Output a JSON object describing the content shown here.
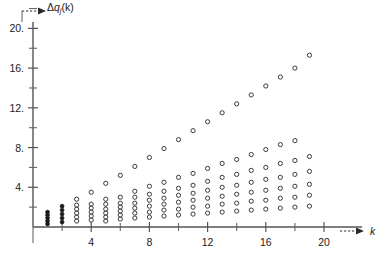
{
  "axes": {
    "y": {
      "label_delta": "Δ",
      "label_q": "q",
      "label_sub": "j",
      "label_arg": "(k)",
      "ticks_major": [
        {
          "value": 4,
          "text": "4."
        },
        {
          "value": 8,
          "text": "8."
        },
        {
          "value": 12,
          "text": "12."
        },
        {
          "value": 16,
          "text": "16."
        },
        {
          "value": 20,
          "text": "20."
        }
      ],
      "ticks_minor": [
        2,
        6,
        10,
        14,
        18,
        22
      ],
      "range": [
        0,
        23
      ]
    },
    "x": {
      "label": "k",
      "ticks_major": [
        {
          "value": 4,
          "text": "4"
        },
        {
          "value": 8,
          "text": "8"
        },
        {
          "value": 12,
          "text": "12"
        },
        {
          "value": 16,
          "text": "16"
        },
        {
          "value": 20,
          "text": "20"
        }
      ],
      "ticks_minor": [
        2,
        6,
        10,
        14,
        18
      ],
      "range": [
        0,
        22
      ]
    }
  },
  "colors": {
    "axis": "#555555",
    "marker": "#3a3a3a",
    "marker_dense": "#1b1b1b",
    "background": "#ffffff",
    "text": "#1a1a1a"
  },
  "chart_data": {
    "type": "scatter",
    "title": "",
    "xlabel": "k",
    "ylabel": "Δq_j(k)",
    "xlim": [
      0,
      22
    ],
    "ylim": [
      0,
      23
    ],
    "grid": false,
    "legend": null,
    "marker": "open-circle",
    "columns": [
      {
        "k": 1,
        "values": [
          0.3,
          0.6,
          0.9,
          1.2,
          1.5
        ]
      },
      {
        "k": 2,
        "values": [
          0.5,
          0.9,
          1.3,
          1.7,
          2.1
        ]
      },
      {
        "k": 3,
        "values": [
          0.6,
          1.0,
          1.4,
          1.8,
          2.2,
          2.8
        ]
      },
      {
        "k": 4,
        "values": [
          0.7,
          1.1,
          1.5,
          1.9,
          2.3,
          3.5
        ]
      },
      {
        "k": 5,
        "values": [
          0.6,
          1.0,
          1.4,
          1.8,
          2.3,
          2.8,
          4.4
        ]
      },
      {
        "k": 6,
        "values": [
          0.8,
          1.2,
          1.6,
          2.0,
          2.4,
          3.0,
          5.2
        ]
      },
      {
        "k": 7,
        "values": [
          0.9,
          1.4,
          1.9,
          2.4,
          3.0,
          3.6,
          6.1
        ]
      },
      {
        "k": 8,
        "values": [
          1.0,
          1.5,
          2.1,
          2.7,
          3.3,
          4.1,
          7.0
        ]
      },
      {
        "k": 9,
        "values": [
          1.1,
          1.7,
          2.3,
          2.9,
          3.6,
          4.5,
          7.9
        ]
      },
      {
        "k": 10,
        "values": [
          1.2,
          1.8,
          2.5,
          3.2,
          3.9,
          5.0,
          8.8
        ]
      },
      {
        "k": 11,
        "values": [
          1.3,
          2.0,
          2.7,
          3.4,
          4.2,
          5.4,
          9.7
        ]
      },
      {
        "k": 12,
        "values": [
          1.4,
          2.1,
          2.9,
          3.7,
          4.6,
          5.9,
          10.6
        ]
      },
      {
        "k": 13,
        "values": [
          1.5,
          2.3,
          3.1,
          4.0,
          5.0,
          6.4,
          11.5
        ]
      },
      {
        "k": 14,
        "values": [
          1.6,
          2.4,
          3.3,
          4.2,
          5.3,
          6.8,
          12.4
        ]
      },
      {
        "k": 15,
        "values": [
          1.7,
          2.6,
          3.5,
          4.5,
          5.7,
          7.3,
          13.3
        ]
      },
      {
        "k": 16,
        "values": [
          1.8,
          2.7,
          3.7,
          4.8,
          6.0,
          7.8,
          14.2
        ]
      },
      {
        "k": 17,
        "values": [
          1.9,
          2.9,
          3.9,
          5.0,
          6.4,
          8.3,
          15.1
        ]
      },
      {
        "k": 18,
        "values": [
          2.0,
          3.0,
          4.1,
          5.3,
          6.7,
          8.7,
          16.0
        ]
      },
      {
        "k": 19,
        "values": [
          2.1,
          3.2,
          4.3,
          5.6,
          7.1,
          17.3
        ]
      }
    ]
  }
}
